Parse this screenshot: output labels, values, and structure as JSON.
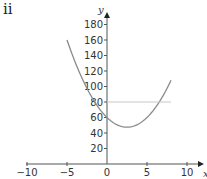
{
  "panel_label": "ii",
  "chart_data": {
    "type": "line",
    "title": "",
    "xlabel": "x",
    "ylabel": "y",
    "xlim": [
      -10,
      10
    ],
    "ylim": [
      0,
      180
    ],
    "x_ticks": [
      -10,
      -5,
      0,
      5,
      10
    ],
    "x_tick_labels": [
      "−10",
      "−5",
      "0",
      "5",
      "10"
    ],
    "y_ticks": [
      20,
      40,
      60,
      80,
      100,
      120,
      140,
      160,
      180
    ],
    "y_tick_labels": [
      "20",
      "40",
      "60",
      "80",
      "100",
      "120",
      "140",
      "160",
      "180"
    ],
    "grid": false,
    "legend": null,
    "series": [
      {
        "name": "curve",
        "description": "parabola y = 2x^2 - 10x + 60, plotted for x from -5 to 8",
        "coefficients": {
          "a": 2,
          "b": -10,
          "c": 60
        },
        "x_range": [
          -5,
          8
        ],
        "color": "#8a8a8a",
        "key_points": [
          {
            "x": -5,
            "y": 160
          },
          {
            "x": 0,
            "y": 60
          },
          {
            "x": 2.5,
            "y": 47.5
          },
          {
            "x": 8,
            "y": 108
          }
        ]
      },
      {
        "name": "horizontal-line",
        "description": "y = 80",
        "y": 80,
        "x_range": [
          0,
          8
        ],
        "color": "#c8c8c8"
      }
    ]
  }
}
